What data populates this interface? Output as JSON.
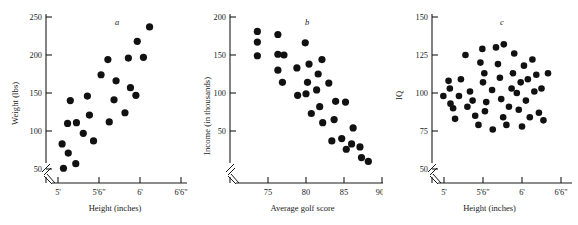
{
  "figure": {
    "title": "",
    "panel_count": 3
  },
  "chart_data": [
    {
      "type": "scatter",
      "panel_label": "a",
      "title": "",
      "xlabel": "Height (inches)",
      "ylabel": "Weight (lbs)",
      "xticks": [
        "5'",
        "5'6\"",
        "6'",
        "6'6\""
      ],
      "xtick_values": [
        60,
        66,
        72,
        78
      ],
      "yticks": [
        "50",
        "100",
        "150",
        "200",
        "250"
      ],
      "ytick_values": [
        50,
        100,
        150,
        200,
        250
      ],
      "xlim": [
        58.5,
        79.5
      ],
      "ylim": [
        40,
        255
      ],
      "axis_break_x": true,
      "axis_break_y": true,
      "grid": false,
      "legend": "none",
      "points": [
        [
          60.8,
          51
        ],
        [
          60.6,
          83
        ],
        [
          61.5,
          71
        ],
        [
          61.4,
          110
        ],
        [
          61.8,
          140
        ],
        [
          62.6,
          57
        ],
        [
          62.7,
          111
        ],
        [
          63.7,
          97
        ],
        [
          64.3,
          146
        ],
        [
          64.6,
          121
        ],
        [
          65.2,
          87
        ],
        [
          66.3,
          174
        ],
        [
          67.3,
          194
        ],
        [
          67.5,
          112
        ],
        [
          68.2,
          141
        ],
        [
          68.5,
          166
        ],
        [
          69.8,
          124
        ],
        [
          70.3,
          196
        ],
        [
          70.6,
          157
        ],
        [
          71.4,
          147
        ],
        [
          71.6,
          218
        ],
        [
          72.5,
          197
        ],
        [
          73.4,
          237
        ]
      ]
    },
    {
      "type": "scatter",
      "panel_label": "b",
      "title": "",
      "xlabel": "Average golf score",
      "ylabel": "Income (in thousands)",
      "xticks": [
        "75",
        "80",
        "85",
        "90"
      ],
      "xtick_values": [
        75,
        80,
        85,
        90
      ],
      "yticks": [
        "50",
        "100",
        "150",
        "200"
      ],
      "ytick_values": [
        50,
        100,
        150,
        200
      ],
      "xlim": [
        72.5,
        90.5
      ],
      "ylim": [
        0,
        205
      ],
      "axis_break_x": true,
      "axis_break_y": true,
      "grid": false,
      "points": [
        [
          73.6,
          181
        ],
        [
          73.6,
          167
        ],
        [
          73.6,
          149
        ],
        [
          76.3,
          177
        ],
        [
          76.3,
          151
        ],
        [
          76.3,
          130
        ],
        [
          77.1,
          150
        ],
        [
          76.9,
          114
        ],
        [
          78.9,
          97
        ],
        [
          78.8,
          133
        ],
        [
          79.9,
          166
        ],
        [
          80.0,
          99
        ],
        [
          80.2,
          114
        ],
        [
          80.4,
          138
        ],
        [
          80.7,
          73
        ],
        [
          81.4,
          104
        ],
        [
          81.6,
          125
        ],
        [
          81.8,
          82
        ],
        [
          82.1,
          144
        ],
        [
          82.2,
          61
        ],
        [
          83.0,
          113
        ],
        [
          83.4,
          37
        ],
        [
          83.7,
          65
        ],
        [
          83.9,
          89
        ],
        [
          84.7,
          40
        ],
        [
          85.2,
          88
        ],
        [
          85.3,
          26
        ],
        [
          86.0,
          33
        ],
        [
          86.2,
          54
        ],
        [
          87.1,
          29
        ],
        [
          87.3,
          15
        ],
        [
          88.2,
          10
        ]
      ]
    },
    {
      "type": "scatter",
      "panel_label": "c",
      "title": "",
      "xlabel": "Height (inches)",
      "ylabel": "IQ",
      "xticks": [
        "5'",
        "5'6\"",
        "6'",
        "6'6\""
      ],
      "xtick_values": [
        60,
        66,
        72,
        78
      ],
      "yticks": [
        "50",
        "75",
        "100",
        "125",
        "150"
      ],
      "ytick_values": [
        50,
        75,
        100,
        125,
        150
      ],
      "xlim": [
        58.5,
        79.5
      ],
      "ylim": [
        45,
        152
      ],
      "axis_break_x": true,
      "axis_break_y": true,
      "grid": false,
      "points": [
        [
          59.9,
          98
        ],
        [
          60.7,
          108
        ],
        [
          60.9,
          103
        ],
        [
          61.0,
          93
        ],
        [
          61.4,
          90
        ],
        [
          61.7,
          83
        ],
        [
          62.3,
          98
        ],
        [
          62.6,
          109
        ],
        [
          63.3,
          125
        ],
        [
          63.6,
          91
        ],
        [
          64.0,
          101
        ],
        [
          64.4,
          95
        ],
        [
          64.8,
          85
        ],
        [
          65.3,
          79
        ],
        [
          65.9,
          129
        ],
        [
          65.6,
          120
        ],
        [
          66.0,
          107
        ],
        [
          66.2,
          113
        ],
        [
          66.5,
          94
        ],
        [
          66.3,
          88
        ],
        [
          67.4,
          102
        ],
        [
          67.5,
          76
        ],
        [
          68.0,
          130
        ],
        [
          68.3,
          119
        ],
        [
          68.6,
          110
        ],
        [
          68.8,
          96
        ],
        [
          69.1,
          84
        ],
        [
          69.2,
          132
        ],
        [
          69.6,
          79
        ],
        [
          70.0,
          91
        ],
        [
          70.4,
          103
        ],
        [
          70.6,
          113
        ],
        [
          70.8,
          126
        ],
        [
          71.2,
          100
        ],
        [
          71.5,
          89
        ],
        [
          71.8,
          107
        ],
        [
          72.0,
          78
        ],
        [
          72.3,
          118
        ],
        [
          72.6,
          95
        ],
        [
          72.9,
          109
        ],
        [
          73.2,
          84
        ],
        [
          73.6,
          122
        ],
        [
          73.9,
          101
        ],
        [
          74.2,
          112
        ],
        [
          74.6,
          87
        ],
        [
          75.0,
          103
        ],
        [
          75.3,
          82
        ],
        [
          76.0,
          113
        ]
      ]
    }
  ]
}
